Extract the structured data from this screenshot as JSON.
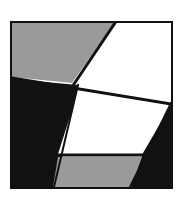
{
  "artwork": {
    "title": "Abstract Geometric Composition",
    "description": "Square framed abstract composition of angular gray, white and black facets",
    "frame": {
      "x": 10,
      "y": 21,
      "width": 163,
      "height": 168,
      "border_width": 2,
      "border_color": "#111111"
    },
    "canvas": {
      "background": "#ffffff",
      "view_width": 159,
      "view_height": 164
    },
    "palette": {
      "gray": "#9a9a9a",
      "white": "#ffffff",
      "black": "#111111",
      "outline": "#111111",
      "page_background": "#ffffff"
    },
    "shapes": [
      {
        "name": "top-left-gray-quad",
        "fill_key": "gray",
        "stroke_key": "outline",
        "stroke_width": 0,
        "points": "0,0 102,0 60,60 0,54"
      },
      {
        "name": "top-right-white-triangle",
        "fill_key": "white",
        "stroke_key": "outline",
        "stroke_width": 0,
        "points": "104,0 159,0 159,78 63,62"
      },
      {
        "name": "left-black-wedge",
        "fill_key": "black",
        "stroke_key": "outline",
        "stroke_width": 0,
        "points": "0,56 66,62 44,164 0,164"
      },
      {
        "name": "center-white-parallelogram",
        "fill_key": "white",
        "stroke_key": "outline",
        "stroke_width": 0,
        "points": "68,62 159,80 130,131 46,131"
      },
      {
        "name": "right-black-wedge",
        "fill_key": "black",
        "stroke_key": "outline",
        "stroke_width": 0,
        "points": "159,82 159,164 119,164 131,130"
      },
      {
        "name": "bottom-gray-parallelogram",
        "fill_key": "gray",
        "stroke_key": "outline",
        "stroke_width": 0,
        "points": "46,134 130,134 118,164 41,164"
      }
    ],
    "edges": [
      {
        "name": "top-diagonal-edge",
        "stroke_key": "outline",
        "stroke_width": 3,
        "x1": 103,
        "y1": 0,
        "x2": 62,
        "y2": 61
      },
      {
        "name": "upper-horizontal-edge",
        "stroke_key": "outline",
        "stroke_width": 3,
        "x1": 0,
        "y1": 55,
        "x2": 159,
        "y2": 81
      },
      {
        "name": "lower-horizontal-edge",
        "stroke_key": "outline",
        "stroke_width": 3,
        "x1": 45,
        "y1": 132,
        "x2": 131,
        "y2": 132
      },
      {
        "name": "left-black-gray-edge",
        "stroke_key": "outline",
        "stroke_width": 2,
        "x1": 66,
        "y1": 62,
        "x2": 42,
        "y2": 164
      },
      {
        "name": "right-black-white-edge",
        "stroke_key": "outline",
        "stroke_width": 2,
        "x1": 159,
        "y1": 80,
        "x2": 118,
        "y2": 164
      }
    ]
  }
}
